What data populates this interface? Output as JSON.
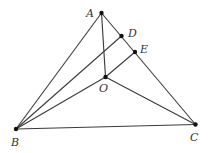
{
  "diagram": {
    "type": "geometry-triangle",
    "points": {
      "A": {
        "label": "A",
        "x": 101.5,
        "y": 13,
        "lx": 86,
        "ly": 17
      },
      "D": {
        "label": "D",
        "x": 121.5,
        "y": 36,
        "lx": 128,
        "ly": 37
      },
      "E": {
        "label": "E",
        "x": 135,
        "y": 52,
        "lx": 140,
        "ly": 53
      },
      "O": {
        "label": "O",
        "x": 105.5,
        "y": 77,
        "lx": 99,
        "ly": 92
      },
      "B": {
        "label": "B",
        "x": 16,
        "y": 129,
        "lx": 11,
        "ly": 146
      },
      "C": {
        "label": "C",
        "x": 195.5,
        "y": 124.5,
        "lx": 190,
        "ly": 141
      }
    },
    "segments": [
      {
        "name": "segment-AB",
        "from": "A",
        "to": "B"
      },
      {
        "name": "segment-AC",
        "from": "A",
        "to": "C"
      },
      {
        "name": "segment-BC",
        "from": "B",
        "to": "C"
      },
      {
        "name": "segment-AO",
        "from": "A",
        "to": "O"
      },
      {
        "name": "segment-BD",
        "from": "B",
        "to": "D"
      },
      {
        "name": "segment-BO",
        "from": "B",
        "to": "O"
      },
      {
        "name": "segment-OE",
        "from": "O",
        "to": "E"
      },
      {
        "name": "segment-OC",
        "from": "O",
        "to": "C"
      }
    ],
    "colors": {
      "line": "#3a3a3a",
      "point": "#111111",
      "label": "#333333"
    }
  }
}
